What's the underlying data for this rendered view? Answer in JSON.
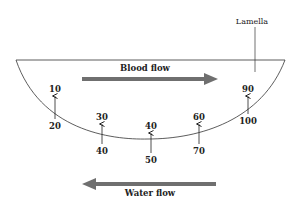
{
  "labels": {
    "lamella": "Lamella",
    "blood_flow": "Blood flow",
    "water_flow": "Water flow"
  },
  "colors": {
    "arrow": "#6f6f6f",
    "line": "#333333",
    "text": "#222222"
  },
  "exchange_points": [
    {
      "blood_value": "10",
      "water_value": "20"
    },
    {
      "blood_value": "30",
      "water_value": "40"
    },
    {
      "blood_value": "40",
      "water_value": "50"
    },
    {
      "blood_value": "60",
      "water_value": "70"
    },
    {
      "blood_value": "90",
      "water_value": "100"
    }
  ]
}
